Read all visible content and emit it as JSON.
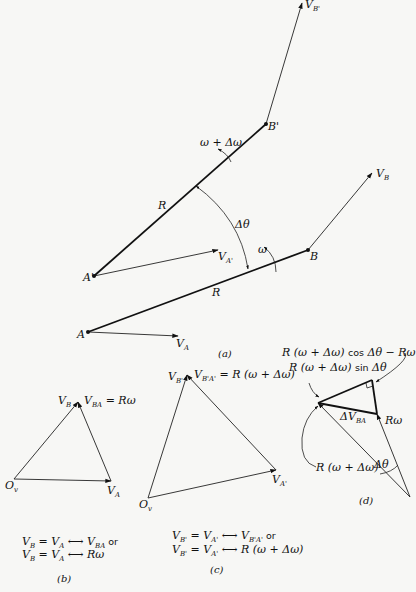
{
  "figure": {
    "parts": {
      "a": {
        "caption": "(a)",
        "points": {
          "A": "A",
          "A_prime": "A'",
          "B": "B",
          "B_prime": "B'"
        },
        "vectors": {
          "V_A": "V",
          "V_A_sub": "A",
          "V_A_prime": "V",
          "V_A_prime_sub": "A'",
          "V_B": "V",
          "V_B_sub": "B",
          "V_B_prime": "V",
          "V_B_prime_sub": "B'"
        },
        "labels": {
          "R_upper": "R",
          "R_lower": "R",
          "delta_theta": "Δθ",
          "omega": "ω",
          "omega_plus": "ω + Δω"
        }
      },
      "b": {
        "caption": "(b)",
        "origin": "O",
        "origin_sub": "v",
        "apex": "V",
        "apex_sub": "B",
        "v_ba": "V",
        "v_ba_sub": "BA",
        "v_ba_eq": " = Rω",
        "va": "V",
        "va_sub": "A",
        "eq1_a": "V",
        "eq1_a_sub": "B",
        "eq1_b": " = V",
        "eq1_b_sub": "A",
        "eq1_c": " ⟷ V",
        "eq1_c_sub": "BA",
        "eq1_or": " or",
        "eq2_a": "V",
        "eq2_a_sub": "B",
        "eq2_b": " = V",
        "eq2_b_sub": "A",
        "eq2_c": " ⟷ Rω"
      },
      "c": {
        "caption": "(c)",
        "origin": "O",
        "origin_sub": "v",
        "apex": "V",
        "apex_sub": "B'",
        "v_ba": "V",
        "v_ba_sub": "B'A'",
        "v_ba_eq": " = R (ω + Δω)",
        "va": "V",
        "va_sub": "A'",
        "eq1_a": "V",
        "eq1_a_sub": "B'",
        "eq1_b": " = V",
        "eq1_b_sub": "A'",
        "eq1_c": " ⟷ V",
        "eq1_c_sub": "B'A'",
        "eq1_or": " or",
        "eq2_a": "V",
        "eq2_a_sub": "B'",
        "eq2_b": " = V",
        "eq2_b_sub": "A'",
        "eq2_c": " ⟷ R (ω + Δω)"
      },
      "d": {
        "caption": "(d)",
        "cos_label_a": "R (ω + Δω) ",
        "cos_label_cos": "cos",
        "cos_label_b": " Δθ − Rω",
        "sin_label_a": "R (ω + Δω) ",
        "sin_label_sin": "sin",
        "sin_label_b": " Δθ",
        "dv": "ΔV",
        "dv_sub": "BA",
        "r_omega": "Rω",
        "r_omega_plus": "R (ω + Δω)",
        "delta_theta": "Δθ"
      }
    }
  }
}
